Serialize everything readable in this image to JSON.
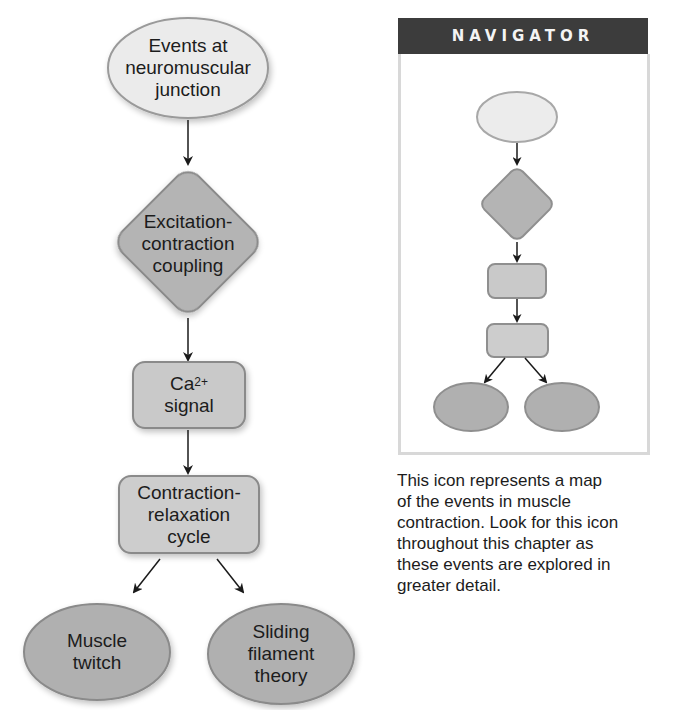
{
  "main_flowchart": {
    "nodes": [
      {
        "id": "neuromuscular",
        "shape": "ellipse",
        "lines": [
          "Events at",
          "neuromuscular",
          "junction"
        ],
        "fill": "#ebebeb"
      },
      {
        "id": "ec_coupling",
        "shape": "diamond",
        "lines": [
          "Excitation-",
          "contraction",
          "coupling"
        ],
        "fill": "#b4b4b4"
      },
      {
        "id": "ca_signal",
        "shape": "rounded-rect",
        "lines": [
          "Ca",
          "signal"
        ],
        "superscript": "2+",
        "fill": "#c9c9c9"
      },
      {
        "id": "cr_cycle",
        "shape": "rounded-rect",
        "lines": [
          "Contraction-",
          "relaxation",
          "cycle"
        ],
        "fill": "#cdcdcd"
      },
      {
        "id": "muscle_twitch",
        "shape": "ellipse",
        "lines": [
          "Muscle",
          "twitch"
        ],
        "fill": "#b0b0b0"
      },
      {
        "id": "sliding_filament",
        "shape": "ellipse",
        "lines": [
          "Sliding",
          "filament",
          "theory"
        ],
        "fill": "#b0b0b0"
      }
    ],
    "edges": [
      {
        "from": "neuromuscular",
        "to": "ec_coupling"
      },
      {
        "from": "ec_coupling",
        "to": "ca_signal"
      },
      {
        "from": "ca_signal",
        "to": "cr_cycle"
      },
      {
        "from": "cr_cycle",
        "to": "muscle_twitch"
      },
      {
        "from": "cr_cycle",
        "to": "sliding_filament"
      }
    ]
  },
  "navigator": {
    "title": "NAVIGATOR",
    "header_color": "#3c3c3c",
    "icon_nodes": [
      "ellipse-light",
      "diamond",
      "rounded-rect",
      "rounded-rect",
      "ellipse-dark",
      "ellipse-dark"
    ]
  },
  "caption": {
    "lines": [
      "This icon represents a map",
      "of the events in muscle",
      "contraction. Look for this icon",
      "throughout this chapter as",
      "these events are explored in",
      "greater detail."
    ]
  },
  "colors": {
    "stroke": "#8a8a8a",
    "arrow": "#1a1a1a",
    "light_fill": "#ebebeb",
    "mid_fill": "#c9c9c9",
    "dark_fill": "#b0b0b0"
  }
}
